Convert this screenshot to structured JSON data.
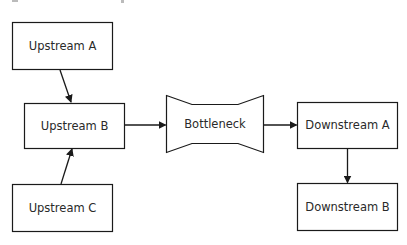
{
  "diagram": {
    "type": "flow",
    "stroke_color": "#1a1a1a",
    "text_color": "#2a2a2a",
    "background": "#ffffff",
    "nodes": [
      {
        "id": "upstream_a",
        "label": "Upstream A",
        "shape": "rect"
      },
      {
        "id": "upstream_b",
        "label": "Upstream B",
        "shape": "rect"
      },
      {
        "id": "upstream_c",
        "label": "Upstream C",
        "shape": "rect"
      },
      {
        "id": "bottleneck",
        "label": "Bottleneck",
        "shape": "bottleneck"
      },
      {
        "id": "downstream_a",
        "label": "Downstream A",
        "shape": "rect"
      },
      {
        "id": "downstream_b",
        "label": "Downstream B",
        "shape": "rect"
      }
    ],
    "edges": [
      {
        "from": "upstream_a",
        "to": "upstream_b"
      },
      {
        "from": "upstream_c",
        "to": "upstream_b"
      },
      {
        "from": "upstream_b",
        "to": "bottleneck"
      },
      {
        "from": "bottleneck",
        "to": "downstream_a"
      },
      {
        "from": "downstream_a",
        "to": "downstream_b"
      }
    ]
  }
}
